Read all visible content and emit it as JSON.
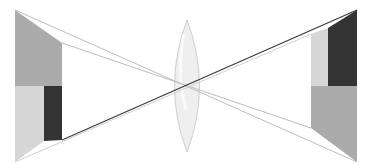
{
  "diagram": {
    "type": "optics-lens-projection",
    "colors": {
      "background": "#ffffff",
      "medium_gray": "#ababab",
      "light_gray": "#d6d6d6",
      "dark": "#333333",
      "ray_light": "#bdbdbd",
      "ray_dark": "#3a3a3a",
      "lens_fill": "#ececec",
      "lens_stroke": "#c4c4c4"
    },
    "object": {
      "label": "object",
      "outer_edge": {
        "x": 15,
        "y_top": 10,
        "y_bottom": 162
      },
      "inner_edge": {
        "x": 62,
        "y_top": 43,
        "y_bottom": 140
      },
      "split_y": 86,
      "dark_block_x": 44
    },
    "lens": {
      "label": "convex lens",
      "center_x": 187,
      "y_top": 20,
      "y_bottom": 152,
      "half_width": 20
    },
    "image": {
      "label": "inverted image",
      "outer_edge": {
        "x": 357,
        "y_top": 10,
        "y_bottom": 162
      },
      "inner_edge": {
        "x": 311,
        "y_top": 34,
        "y_bottom": 128
      },
      "split_y": 86,
      "dark_block_x": 328
    },
    "rays": [
      {
        "from": [
          15,
          10
        ],
        "to": [
          357,
          162
        ],
        "style": "light"
      },
      {
        "from": [
          62,
          43
        ],
        "to": [
          311,
          128
        ],
        "style": "light"
      },
      {
        "from": [
          15,
          162
        ],
        "to": [
          311,
          34
        ],
        "style": "light"
      },
      {
        "from": [
          62,
          140
        ],
        "to": [
          357,
          10
        ],
        "style": "dark"
      }
    ]
  }
}
